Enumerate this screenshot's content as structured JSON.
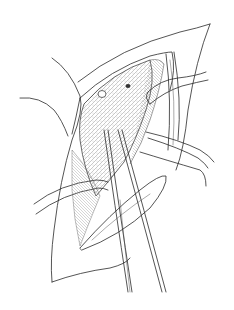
{
  "illustration": {
    "subject": "surgical-exposure-line-drawing",
    "style": "pen-and-ink",
    "colors": {
      "background": "#ffffff",
      "ink": "#2a2a2a"
    }
  },
  "signature": {
    "text": ""
  }
}
